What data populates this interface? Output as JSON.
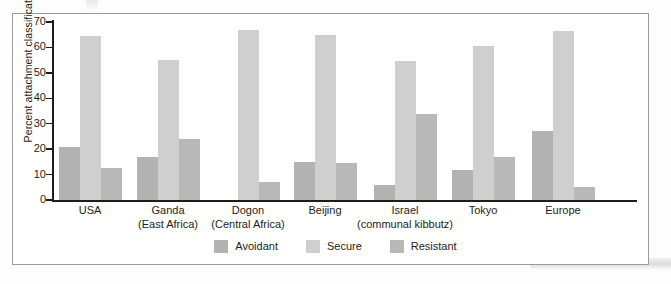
{
  "chart_data": {
    "type": "bar",
    "title": "",
    "subtitle": "",
    "xlabel": "",
    "ylabel": "Percent attachment classification",
    "ylim": [
      0,
      70
    ],
    "yticks": [
      0,
      10,
      20,
      30,
      40,
      50,
      60,
      70
    ],
    "ytick_labels": [
      "0",
      "10",
      "20",
      "30",
      "40",
      "50",
      "60",
      "70"
    ],
    "grid": false,
    "legend_position": "bottom-center",
    "categories": [
      "USA",
      "Ganda\n(East Africa)",
      "Dogon\n(Central Africa)",
      "Beijing",
      "Israel\n(communal kibbutz)",
      "Tokyo",
      "Europe"
    ],
    "category_labels": [
      {
        "main": "USA",
        "sub": ""
      },
      {
        "main": "Ganda",
        "sub": "(East Africa)"
      },
      {
        "main": "Dogon",
        "sub": "(Central Africa)"
      },
      {
        "main": "Beijing",
        "sub": ""
      },
      {
        "main": "Israel",
        "sub": "(communal kibbutz)"
      },
      {
        "main": "Tokyo",
        "sub": ""
      },
      {
        "main": "Europe",
        "sub": ""
      }
    ],
    "series": [
      {
        "name": "Avoidant",
        "color": "#b2b2b0",
        "values": [
          21,
          17,
          0,
          15,
          6,
          12,
          27
        ]
      },
      {
        "name": "Secure",
        "color": "#cfcfcd",
        "values": [
          64.5,
          55,
          67,
          65,
          54.5,
          60.5,
          66.5
        ]
      },
      {
        "name": "Resistant",
        "color": "#b8b8b6",
        "values": [
          12.5,
          24,
          7,
          14.5,
          34,
          17,
          5
        ]
      }
    ]
  },
  "legend": {
    "items": [
      {
        "label": "Avoidant",
        "key": "avoidant"
      },
      {
        "label": "Secure",
        "key": "secure"
      },
      {
        "label": "Resistant",
        "key": "resistant"
      }
    ]
  },
  "axis": {
    "y_title": "Percent attachment classification"
  },
  "colors": {
    "avoidant": "#b2b2b0",
    "secure": "#cfcfcd",
    "resistant": "#b8b8b6",
    "axis": "#1d1d1b",
    "frame": "#9a9a99",
    "page": "#fdfdfc"
  }
}
